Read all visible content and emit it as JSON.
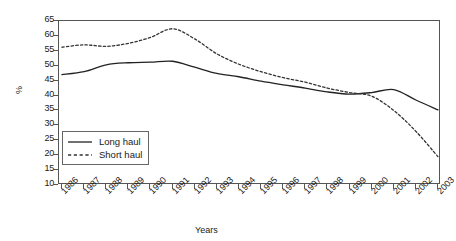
{
  "chart_data": {
    "type": "line",
    "title": "",
    "xlabel": "Years",
    "ylabel": "%",
    "ylim": [
      10,
      65
    ],
    "yticks": [
      10,
      15,
      20,
      25,
      30,
      35,
      40,
      45,
      50,
      55,
      60,
      65
    ],
    "grid": false,
    "legend_position": "inside-lower-left",
    "categories": [
      "1986",
      "1987",
      "1988",
      "1989",
      "1990",
      "1991",
      "1992",
      "1993",
      "1994",
      "1995",
      "1996",
      "1997",
      "1998",
      "1999",
      "2000",
      "2001",
      "2002",
      "2003"
    ],
    "x": [
      1986,
      1987,
      1988,
      1989,
      1990,
      1991,
      1992,
      1993,
      1994,
      1995,
      1996,
      1997,
      1998,
      1999,
      2000,
      2001,
      2002,
      2003
    ],
    "series": [
      {
        "name": "Long haul",
        "style": "solid",
        "color": "#222222",
        "values": [
          47.0,
          48.0,
          50.3,
          51.0,
          51.2,
          51.5,
          49.5,
          47.4,
          46.3,
          44.8,
          43.6,
          42.5,
          41.2,
          40.5,
          41.0,
          42.0,
          38.5,
          35.2
        ]
      },
      {
        "name": "Short haul",
        "style": "dashed",
        "color": "#333333",
        "values": [
          56.2,
          57.0,
          56.5,
          57.5,
          59.5,
          62.4,
          59.0,
          54.0,
          50.5,
          48.0,
          46.0,
          44.5,
          42.5,
          41.0,
          39.8,
          35.0,
          28.0,
          19.5
        ]
      }
    ],
    "annotations": []
  },
  "legend": {
    "items": [
      {
        "label": "Long haul",
        "style": "solid"
      },
      {
        "label": "Short haul",
        "style": "dashed"
      }
    ]
  },
  "axes": {
    "y_title": "%",
    "x_title": "Years"
  }
}
